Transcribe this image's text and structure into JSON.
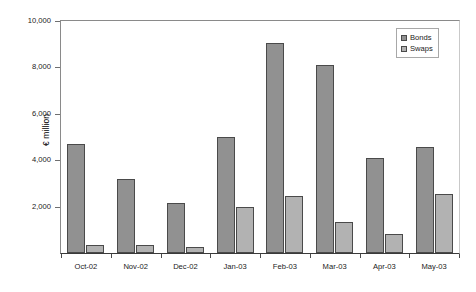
{
  "chart_data": {
    "type": "bar",
    "title": "",
    "xlabel": "",
    "ylabel": "€ million",
    "ylim": [
      0,
      10000
    ],
    "ytick_labels": [
      "10,000",
      "8,000",
      "6,000",
      "4,000",
      "2,000"
    ],
    "ytick_values": [
      10000,
      8000,
      6000,
      4000,
      2000
    ],
    "grid": false,
    "legend_position": "top-right",
    "categories": [
      "Oct-02",
      "Nov-02",
      "Dec-02",
      "Jan-03",
      "Feb-03",
      "Mar-03",
      "Apr-03",
      "May-03"
    ],
    "series": [
      {
        "name": "Bonds",
        "color": "#919191",
        "values": [
          4700,
          3200,
          2150,
          5000,
          9050,
          8100,
          4100,
          4550
        ]
      },
      {
        "name": "Swaps",
        "color": "#b2b2b2",
        "values": [
          350,
          330,
          250,
          2000,
          2450,
          1350,
          800,
          2550
        ]
      }
    ]
  },
  "legend": {
    "items": [
      {
        "label": "Bonds",
        "swatch": "bonds-swatch"
      },
      {
        "label": "Swaps",
        "swatch": "swaps-swatch"
      }
    ]
  }
}
